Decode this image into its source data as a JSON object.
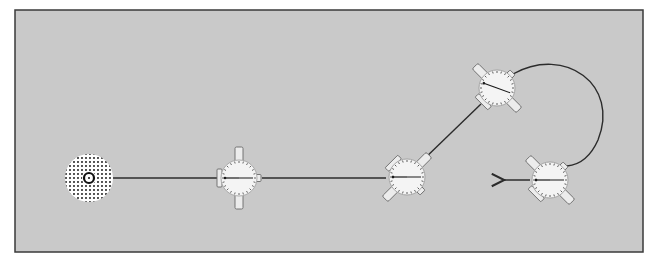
{
  "diagram": {
    "panel": {
      "x": 15,
      "y": 10,
      "width": 628,
      "height": 242,
      "fill": "#c9c9c9",
      "stroke": "#3a3a3a"
    },
    "colors": {
      "background": "#ffffff",
      "panel": "#c9c9c9",
      "line": "#2b2b2b",
      "dial_face": "#f4f4f4",
      "dial_ticks": "#555555",
      "wing": "#ececec",
      "wing_stroke": "#6a6a6a",
      "base_dots": "#2a2a2a"
    },
    "base_station": {
      "cx": 89,
      "cy": 178,
      "r": 24,
      "inner_ring_r": 5
    },
    "robots": [
      {
        "id": "robot-1",
        "cx": 239,
        "cy": 178,
        "rotation": 0,
        "needle_angle": 180
      },
      {
        "id": "robot-2",
        "cx": 407,
        "cy": 177,
        "rotation": 45,
        "needle_angle": 180
      },
      {
        "id": "robot-3",
        "cx": 497,
        "cy": 88,
        "rotation": -45,
        "needle_angle": 200
      },
      {
        "id": "robot-4",
        "cx": 550,
        "cy": 180,
        "rotation": -45,
        "needle_angle": 180
      }
    ],
    "paths": [
      {
        "id": "tether-base-to-robot1",
        "type": "line",
        "x1": 113,
        "y1": 178,
        "x2": 220,
        "y2": 178
      },
      {
        "id": "tether-robot1-to-robot2",
        "type": "line",
        "x1": 262,
        "y1": 178,
        "x2": 386,
        "y2": 178
      },
      {
        "id": "tether-robot2-to-robot3",
        "type": "line",
        "x1": 422,
        "y1": 161,
        "x2": 481,
        "y2": 104
      },
      {
        "id": "tether-robot3-to-robot4",
        "type": "arc",
        "d": "M 513 74 C 565 45, 620 85, 598 140 C 590 158, 578 165, 567 166"
      }
    ],
    "arrow": {
      "x1": 530,
      "y1": 180,
      "x2": 503,
      "y2": 180
    }
  }
}
